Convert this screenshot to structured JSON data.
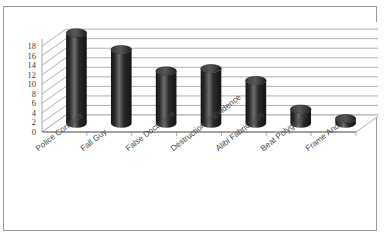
{
  "scan": {
    "top_remnant_text": " "
  },
  "chart_data": {
    "type": "bar",
    "title": "",
    "subtitle": "",
    "xlabel": "",
    "ylabel": "",
    "categories": [
      "Police Contacts",
      "Fall Guy",
      "False Document",
      "Destruction of Evidence",
      "Alibi Fabrication",
      "Beat Polygraph",
      "Frame Another"
    ],
    "values": [
      19,
      15.5,
      11,
      11.5,
      9,
      3,
      1
    ],
    "series": [
      {
        "name": "",
        "values": [
          19,
          15.5,
          11,
          11.5,
          9,
          3,
          1
        ]
      }
    ],
    "ylim": [
      0,
      19.5
    ],
    "ytick_values": [
      0,
      2,
      4,
      6,
      8,
      10,
      12,
      14,
      16,
      18
    ],
    "ytick_labels": [
      "0",
      "2",
      "4",
      "6",
      "8",
      "10",
      "12",
      "14",
      "16",
      "18"
    ],
    "grid": true,
    "grid_axis": "y",
    "legend": false,
    "legend_position": "none",
    "bar_style": "3d-cylinder",
    "colors": {
      "bar_fill": "#2b2b2b",
      "bar_highlight": "#6d6d6d",
      "bar_shadow": "#141414",
      "gridline": "#9d9d9d",
      "wall": "#ffffff",
      "floor": "#ffffff",
      "axis_text": "#3b3b3b",
      "frame_border": "#9a9a9a"
    },
    "annotations": []
  }
}
